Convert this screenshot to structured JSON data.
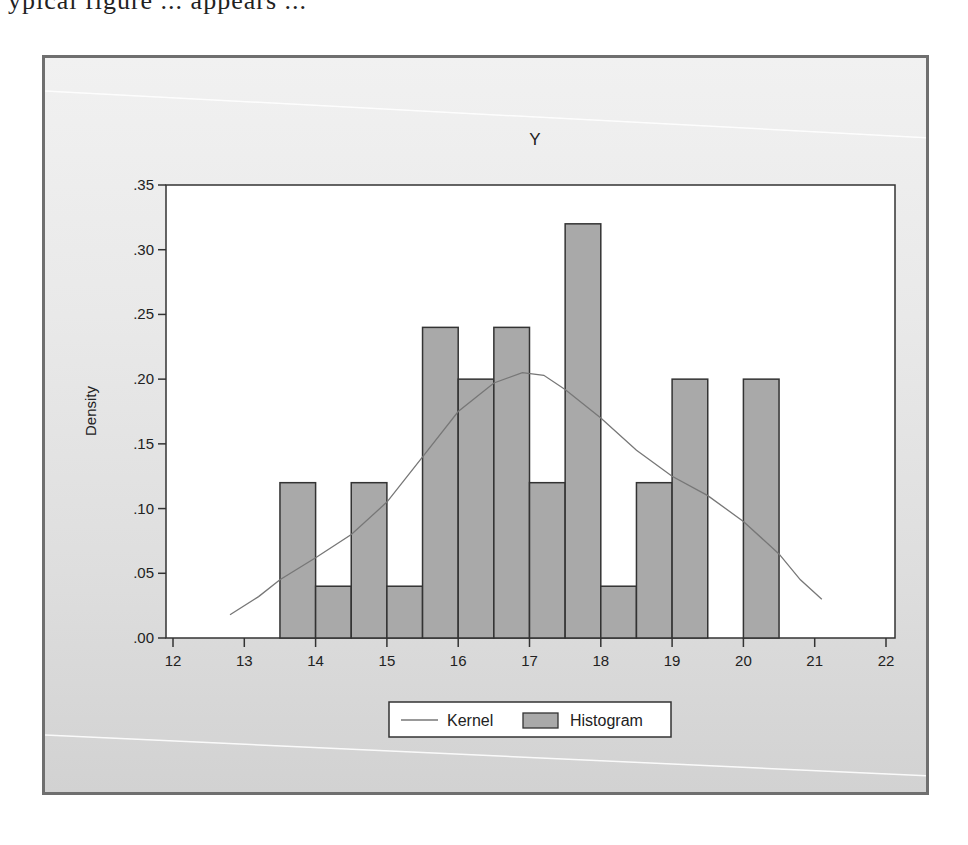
{
  "page": {
    "top_text_fragment": "ypical figure ... appears ..."
  },
  "chart_data": {
    "type": "bar",
    "subtype": "histogram_with_kernel_density",
    "title": "Y",
    "xlabel": "",
    "ylabel": "Density",
    "xlim": [
      12,
      22
    ],
    "ylim": [
      0,
      0.35
    ],
    "x_ticks": [
      "12",
      "13",
      "14",
      "15",
      "16",
      "17",
      "18",
      "19",
      "20",
      "21",
      "22"
    ],
    "y_ticks": [
      ".00",
      ".05",
      ".10",
      ".15",
      ".20",
      ".25",
      ".30",
      ".35"
    ],
    "grid": false,
    "legend_position": "bottom-center",
    "legend": [
      {
        "label": "Kernel",
        "type": "line"
      },
      {
        "label": "Histogram",
        "type": "bar"
      }
    ],
    "bin_width": 0.5,
    "series": [
      {
        "name": "Histogram",
        "color": "#a9a9a9",
        "border": "#333333",
        "bins": [
          {
            "x0": 13.5,
            "x1": 14.0,
            "density": 0.12
          },
          {
            "x0": 14.0,
            "x1": 14.5,
            "density": 0.04
          },
          {
            "x0": 14.5,
            "x1": 15.0,
            "density": 0.12
          },
          {
            "x0": 15.0,
            "x1": 15.5,
            "density": 0.04
          },
          {
            "x0": 15.5,
            "x1": 16.0,
            "density": 0.24
          },
          {
            "x0": 16.0,
            "x1": 16.5,
            "density": 0.2
          },
          {
            "x0": 16.5,
            "x1": 17.0,
            "density": 0.24
          },
          {
            "x0": 17.0,
            "x1": 17.5,
            "density": 0.12
          },
          {
            "x0": 17.5,
            "x1": 18.0,
            "density": 0.32
          },
          {
            "x0": 18.0,
            "x1": 18.5,
            "density": 0.04
          },
          {
            "x0": 18.5,
            "x1": 19.0,
            "density": 0.12
          },
          {
            "x0": 19.0,
            "x1": 19.5,
            "density": 0.2
          },
          {
            "x0": 19.5,
            "x1": 20.0,
            "density": 0.0
          },
          {
            "x0": 20.0,
            "x1": 20.5,
            "density": 0.2
          }
        ]
      },
      {
        "name": "Kernel",
        "color": "#777777",
        "x": [
          12.8,
          13.2,
          13.5,
          14.0,
          14.5,
          15.0,
          15.5,
          16.0,
          16.5,
          16.9,
          17.2,
          17.5,
          18.0,
          18.5,
          19.0,
          19.5,
          20.0,
          20.5,
          20.8,
          21.1
        ],
        "y": [
          0.018,
          0.032,
          0.045,
          0.062,
          0.08,
          0.105,
          0.14,
          0.175,
          0.197,
          0.205,
          0.203,
          0.192,
          0.17,
          0.145,
          0.125,
          0.11,
          0.09,
          0.065,
          0.045,
          0.03
        ]
      }
    ]
  },
  "colors": {
    "frame_border": "#6f6f6f",
    "plot_bg": "#ffffff",
    "bar_fill": "#a9a9a9",
    "bar_border": "#333333",
    "kernel_line": "#777777",
    "axis": "#333333"
  }
}
